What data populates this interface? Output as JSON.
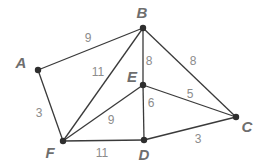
{
  "diagram": {
    "type": "weighted-undirected-graph",
    "nodes": [
      {
        "id": "A",
        "label": "A",
        "x": 38,
        "y": 70,
        "lx": 21,
        "ly": 68
      },
      {
        "id": "B",
        "label": "B",
        "x": 143,
        "y": 28,
        "lx": 142,
        "ly": 18
      },
      {
        "id": "C",
        "label": "C",
        "x": 236,
        "y": 117,
        "lx": 247,
        "ly": 132
      },
      {
        "id": "D",
        "label": "D",
        "x": 144,
        "y": 140,
        "lx": 144,
        "ly": 160
      },
      {
        "id": "E",
        "label": "E",
        "x": 143,
        "y": 85,
        "lx": 132,
        "ly": 82
      },
      {
        "id": "F",
        "label": "F",
        "x": 63,
        "y": 141,
        "lx": 50,
        "ly": 158
      }
    ],
    "edges": [
      {
        "from": "A",
        "to": "B",
        "weight": "9",
        "wx": 88,
        "wy": 42
      },
      {
        "from": "A",
        "to": "F",
        "weight": "3",
        "wx": 39,
        "wy": 117
      },
      {
        "from": "F",
        "to": "B",
        "weight": "11",
        "wx": 98,
        "wy": 76
      },
      {
        "from": "B",
        "to": "E",
        "weight": "8",
        "wx": 149,
        "wy": 65
      },
      {
        "from": "B",
        "to": "C",
        "weight": "8",
        "wx": 193,
        "wy": 65
      },
      {
        "from": "E",
        "to": "C",
        "weight": "5",
        "wx": 190,
        "wy": 98
      },
      {
        "from": "E",
        "to": "D",
        "weight": "6",
        "wx": 151,
        "wy": 107
      },
      {
        "from": "F",
        "to": "E",
        "weight": "9",
        "wx": 111,
        "wy": 124
      },
      {
        "from": "F",
        "to": "D",
        "weight": "11",
        "wx": 102,
        "wy": 157
      },
      {
        "from": "D",
        "to": "C",
        "weight": "3",
        "wx": 198,
        "wy": 143
      }
    ]
  }
}
